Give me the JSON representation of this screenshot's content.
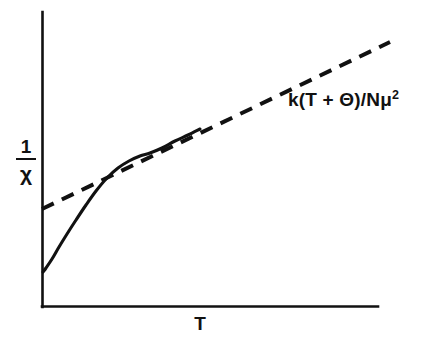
{
  "figure": {
    "background_color": "#ffffff",
    "ink_color": "#111111",
    "axes": {
      "y_axis_label_numerator": "1",
      "y_axis_label_denominator": "χ",
      "x_axis_label": "T"
    },
    "annotations": {
      "asymptote_formula_prefix": "k(T + Θ)/Nμ",
      "asymptote_formula_exponent": "2"
    }
  },
  "chart_data": {
    "type": "line",
    "title": "",
    "subtitle": "",
    "xlabel": "T",
    "ylabel": "1/χ",
    "grid": false,
    "legend_position": "none",
    "axis_style": "two-sided open axes, no tick marks, no numeric tick labels",
    "xlim": [
      0,
      1
    ],
    "ylim": [
      0,
      1
    ],
    "annotations": [
      {
        "text": "k(T + Θ)/Nμ^2",
        "display_text": "k(T + Θ)/Nμ²",
        "target_series": "asymptote",
        "position": "upper-right, above the dashed line",
        "x_px": 288,
        "y_px": 89
      }
    ],
    "series": [
      {
        "name": "inverse susceptibility (measured)",
        "style": "solid",
        "description": "Solid curve: starts low just above the origin on the y-axis, rises steeply with upward curvature, then bends over and merges tangentially into the straight dashed asymptote.",
        "points_px": [
          [
            43,
            272
          ],
          [
            46,
            268
          ],
          [
            52,
            259
          ],
          [
            59,
            247
          ],
          [
            67,
            234
          ],
          [
            76,
            220
          ],
          [
            86,
            205
          ],
          [
            96,
            191
          ],
          [
            107,
            178
          ],
          [
            118,
            168
          ],
          [
            129,
            161
          ],
          [
            140,
            156
          ],
          [
            150,
            153
          ],
          [
            162,
            148
          ],
          [
            175,
            141
          ],
          [
            188,
            135
          ],
          [
            200,
            129
          ]
        ]
      },
      {
        "name": "asymptote",
        "style": "dashed",
        "description": "Straight dashed line of positive slope representing the Curie-Weiss law k(T + Θ)/Nμ²; it intercepts the y-axis above the origin and lies above the solid curve at low T.",
        "dash_pattern_px": [
          13,
          9
        ],
        "points_px": [
          [
            42,
            209
          ],
          [
            390,
            42
          ]
        ],
        "y_intercept_px": 209,
        "slope_px_per_px": -0.48
      }
    ],
    "geometry_px": {
      "origin": [
        42,
        307
      ],
      "y_axis_top": [
        42,
        12
      ],
      "x_axis_right": [
        378,
        307
      ]
    }
  }
}
